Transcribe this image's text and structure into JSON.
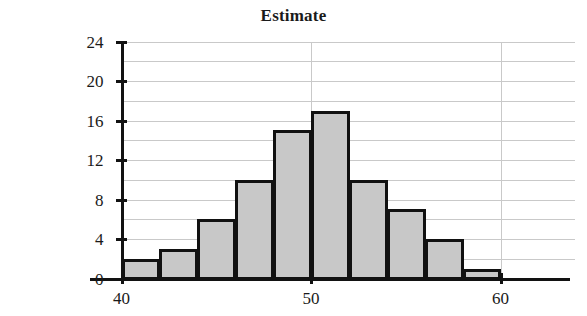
{
  "chart_data": {
    "type": "bar",
    "title": "Estimate",
    "xlabel": "",
    "ylabel": "",
    "categories": [
      "40-42",
      "42-44",
      "44-46",
      "46-48",
      "48-50",
      "50-52",
      "52-54",
      "54-56",
      "56-58",
      "58-60"
    ],
    "bin_edges": [
      40,
      42,
      44,
      46,
      48,
      50,
      52,
      54,
      56,
      58,
      60
    ],
    "values": [
      2,
      3,
      6,
      10,
      15,
      17,
      10,
      7,
      4,
      1
    ],
    "bin_width": 2,
    "xlim": [
      40,
      60
    ],
    "ylim": [
      0,
      24
    ],
    "x_tick_labels": [
      "40",
      "50",
      "60"
    ],
    "x_tick_values": [
      40,
      50,
      60
    ],
    "y_tick_labels": [
      "0",
      "4",
      "8",
      "12",
      "16",
      "20",
      "24"
    ],
    "y_tick_values": [
      0,
      4,
      8,
      12,
      16,
      20,
      24
    ],
    "y_gridline_values": [
      2,
      4,
      6,
      8,
      10,
      12,
      14,
      16,
      18,
      20,
      22,
      24
    ],
    "x_gridline_values": [
      40,
      50,
      60
    ],
    "grid": true,
    "legend": false,
    "bar_fill_color": "#c8c8c8",
    "bar_edge_color": "#111111",
    "grid_color": "#c9c9c9",
    "axis_color": "#121212",
    "background_color": "#ffffff"
  }
}
